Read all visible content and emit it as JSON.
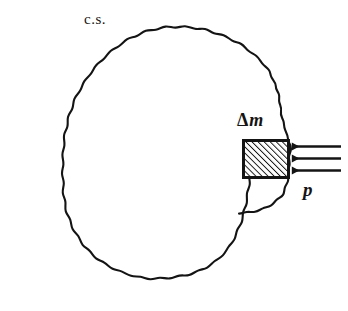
{
  "figure": {
    "background_color": "#ffffff",
    "stroke_color": "#141414",
    "labels": {
      "control_surface": "c.s.",
      "delta_mass_symbol": "Δ",
      "delta_mass_variable": "m",
      "delta_mass_full": "Δm",
      "pressure": "p"
    },
    "elements": {
      "control_surface_name": "control-surface-outline",
      "mass_element_name": "delta-mass-block",
      "pressure_arrows_name": "pressure-arrows",
      "arrow_count": 3,
      "arrow_direction": "left",
      "hatch_angle_deg": 45,
      "hatch_spacing_px": 3
    },
    "geometry": {
      "width": 348,
      "height": 311,
      "block": {
        "x": 243,
        "y": 140,
        "width": 45,
        "height": 37
      },
      "arrow_ys": [
        146,
        158,
        170
      ],
      "arrow_tail_x": 341,
      "arrow_head_x": 289
    }
  }
}
